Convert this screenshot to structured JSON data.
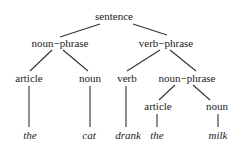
{
  "diagram": {
    "type": "parse-tree",
    "nodes": {
      "root": {
        "label": "sentence",
        "x": 114,
        "y": 20
      },
      "np1": {
        "label": "noun−phrase",
        "x": 60,
        "y": 47
      },
      "vp": {
        "label": "verb−phrase",
        "x": 166,
        "y": 47
      },
      "art1": {
        "label": "article",
        "x": 29,
        "y": 82
      },
      "noun1": {
        "label": "noun",
        "x": 90,
        "y": 82
      },
      "verb": {
        "label": "verb",
        "x": 127,
        "y": 82
      },
      "np2": {
        "label": "noun−phrase",
        "x": 187,
        "y": 82
      },
      "art2": {
        "label": "article",
        "x": 158,
        "y": 110
      },
      "noun2": {
        "label": "noun",
        "x": 217,
        "y": 110
      }
    },
    "leaves": {
      "w1": {
        "label": "the",
        "x": 30,
        "y": 139
      },
      "w2": {
        "label": "cat",
        "x": 89,
        "y": 139
      },
      "w3": {
        "label": "drank",
        "x": 128,
        "y": 139
      },
      "w4": {
        "label": "the",
        "x": 157,
        "y": 139
      },
      "w5": {
        "label": "milk",
        "x": 218,
        "y": 139
      }
    },
    "edges": [
      [
        "sentence",
        "noun-phrase"
      ],
      [
        "sentence",
        "verb-phrase"
      ],
      [
        "noun-phrase",
        "article"
      ],
      [
        "noun-phrase",
        "noun"
      ],
      [
        "verb-phrase",
        "verb"
      ],
      [
        "verb-phrase",
        "noun-phrase"
      ],
      [
        "noun-phrase",
        "article"
      ],
      [
        "noun-phrase",
        "noun"
      ],
      [
        "article",
        "the"
      ],
      [
        "noun",
        "cat"
      ],
      [
        "verb",
        "drank"
      ],
      [
        "article",
        "the"
      ],
      [
        "noun",
        "milk"
      ]
    ]
  }
}
